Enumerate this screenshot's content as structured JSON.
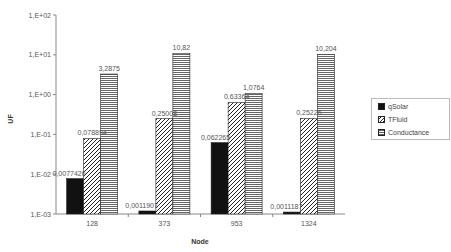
{
  "chart_data": {
    "type": "bar",
    "title": "",
    "xlabel": "Node",
    "ylabel": "UF",
    "yscale": "log",
    "ylim": [
      0.001,
      100
    ],
    "yticks": [
      "1,E+02",
      "1,E+01",
      "1,E+00",
      "1,E-01",
      "1,E-02",
      "1,E-03"
    ],
    "categories": [
      "128",
      "373",
      "953",
      "1324"
    ],
    "series": [
      {
        "name": "qSolar",
        "pattern": "solid-black",
        "values": [
          0.0077426,
          0.0011907,
          0.062265,
          0.0011187
        ],
        "labels": [
          "0,0077426",
          "0,0011907",
          "0,062265",
          "0,0011187"
        ]
      },
      {
        "name": "TFluid",
        "pattern": "diagonal-hatch",
        "values": [
          0.078894,
          0.25008,
          0.63364,
          0.25226
        ],
        "labels": [
          "0,078894",
          "0,25008",
          "0,63364",
          "0,25226"
        ]
      },
      {
        "name": "Conductance",
        "pattern": "horizontal-lines",
        "values": [
          3.2875,
          10.82,
          1.0764,
          10.204
        ],
        "labels": [
          "3,2875",
          "10,82",
          "1,0764",
          "10,204"
        ]
      }
    ],
    "legend_position": "right",
    "grid": false
  },
  "legend": {
    "items": [
      {
        "label": "qSolar"
      },
      {
        "label": "TFluid"
      },
      {
        "label": "Conductance"
      }
    ]
  },
  "axes": {
    "xlabel": "Node",
    "ylabel": "UF"
  }
}
